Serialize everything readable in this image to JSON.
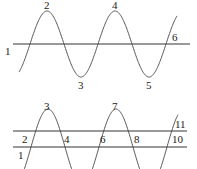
{
  "diagram": {
    "top": {
      "labels": [
        {
          "text": "1",
          "x": 5,
          "y": 55
        },
        {
          "text": "2",
          "x": 44,
          "y": 9
        },
        {
          "text": "3",
          "x": 78,
          "y": 89
        },
        {
          "text": "4",
          "x": 112,
          "y": 9
        },
        {
          "text": "5",
          "x": 146,
          "y": 89
        },
        {
          "text": "6",
          "x": 172,
          "y": 41
        }
      ]
    },
    "bottom": {
      "labels": [
        {
          "text": "1",
          "x": 18,
          "y": 159
        },
        {
          "text": "2",
          "x": 22,
          "y": 143
        },
        {
          "text": "3",
          "x": 44,
          "y": 110
        },
        {
          "text": "4",
          "x": 64,
          "y": 143
        },
        {
          "text": "6",
          "x": 100,
          "y": 143
        },
        {
          "text": "7",
          "x": 112,
          "y": 110
        },
        {
          "text": "8",
          "x": 134,
          "y": 143
        },
        {
          "text": "11",
          "x": 175,
          "y": 128
        },
        {
          "text": "10",
          "x": 172,
          "y": 143
        }
      ]
    },
    "colors": {
      "line": "#333333",
      "curve": "#444444"
    }
  }
}
